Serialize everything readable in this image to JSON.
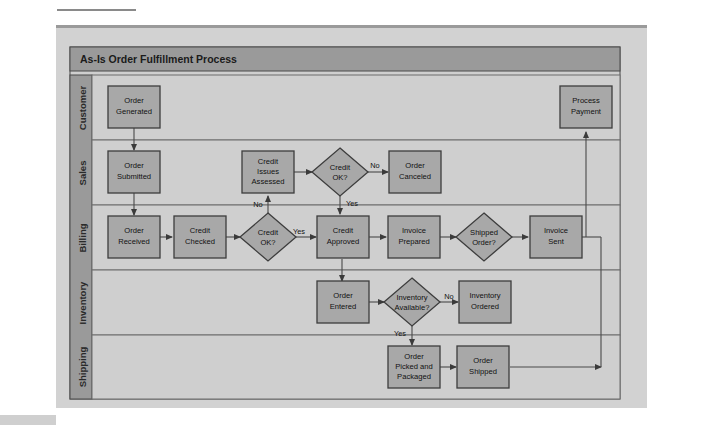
{
  "figure": {
    "title": "As-Is Order Fulfillment Process",
    "colors": {
      "panel_bg": "#d2d2d2",
      "title_bar": "#9a9a9a",
      "lane_header": "#9a9a9a",
      "lane_bg_light": "#cfcfcf",
      "node_fill": "#a8a8a8",
      "node_border": "#3d3d3d",
      "line": "#4a4a4a"
    }
  },
  "lanes": [
    {
      "id": "lane-customer",
      "label": "Customer"
    },
    {
      "id": "lane-sales",
      "label": "Sales"
    },
    {
      "id": "lane-billing",
      "label": "Billing"
    },
    {
      "id": "lane-inventory",
      "label": "Inventory"
    },
    {
      "id": "lane-shipping",
      "label": "Shipping"
    }
  ],
  "nodes": [
    {
      "id": "order-generated",
      "lane": "Customer",
      "shape": "process",
      "lines": [
        "Order",
        "Generated"
      ]
    },
    {
      "id": "process-payment",
      "lane": "Customer",
      "shape": "process",
      "lines": [
        "Process",
        "Payment"
      ]
    },
    {
      "id": "order-submitted",
      "lane": "Sales",
      "shape": "process",
      "lines": [
        "Order",
        "Submitted"
      ]
    },
    {
      "id": "credit-issues-assessed",
      "lane": "Sales",
      "shape": "process",
      "lines": [
        "Credit",
        "Issues",
        "Assessed"
      ]
    },
    {
      "id": "credit-ok-sales",
      "lane": "Sales",
      "shape": "decision",
      "lines": [
        "Credit",
        "OK?"
      ]
    },
    {
      "id": "order-canceled",
      "lane": "Sales",
      "shape": "process",
      "lines": [
        "Order",
        "Canceled"
      ]
    },
    {
      "id": "order-received",
      "lane": "Billing",
      "shape": "process",
      "lines": [
        "Order",
        "Received"
      ]
    },
    {
      "id": "credit-checked",
      "lane": "Billing",
      "shape": "process",
      "lines": [
        "Credit",
        "Checked"
      ]
    },
    {
      "id": "credit-ok-billing",
      "lane": "Billing",
      "shape": "decision",
      "lines": [
        "Credit",
        "OK?"
      ]
    },
    {
      "id": "credit-approved",
      "lane": "Billing",
      "shape": "process",
      "lines": [
        "Credit",
        "Approved"
      ]
    },
    {
      "id": "invoice-prepared",
      "lane": "Billing",
      "shape": "process",
      "lines": [
        "Invoice",
        "Prepared"
      ]
    },
    {
      "id": "shipped-order",
      "lane": "Billing",
      "shape": "decision",
      "lines": [
        "Shipped",
        "Order?"
      ]
    },
    {
      "id": "invoice-sent",
      "lane": "Billing",
      "shape": "process",
      "lines": [
        "Invoice",
        "Sent"
      ]
    },
    {
      "id": "order-entered",
      "lane": "Inventory",
      "shape": "process",
      "lines": [
        "Order",
        "Entered"
      ]
    },
    {
      "id": "inventory-available",
      "lane": "Inventory",
      "shape": "decision",
      "lines": [
        "Inventory",
        "Available?"
      ]
    },
    {
      "id": "inventory-ordered",
      "lane": "Inventory",
      "shape": "process",
      "lines": [
        "Inventory",
        "Ordered"
      ]
    },
    {
      "id": "order-picked-packaged",
      "lane": "Shipping",
      "shape": "process",
      "lines": [
        "Order",
        "Picked and",
        "Packaged"
      ]
    },
    {
      "id": "order-shipped",
      "lane": "Shipping",
      "shape": "process",
      "lines": [
        "Order",
        "Shipped"
      ]
    }
  ],
  "edges": [
    {
      "id": "e-generated-submitted",
      "from": "order-generated",
      "to": "order-submitted",
      "label": ""
    },
    {
      "id": "e-submitted-received",
      "from": "order-submitted",
      "to": "order-received",
      "label": ""
    },
    {
      "id": "e-received-checked",
      "from": "order-received",
      "to": "credit-checked",
      "label": ""
    },
    {
      "id": "e-checked-creditok",
      "from": "credit-checked",
      "to": "credit-ok-billing",
      "label": ""
    },
    {
      "id": "e-creditok-billing-yes",
      "from": "credit-ok-billing",
      "to": "credit-approved",
      "label": "Yes"
    },
    {
      "id": "e-creditok-billing-no",
      "from": "credit-ok-billing",
      "to": "credit-issues-assessed",
      "label": "No"
    },
    {
      "id": "e-issues-creditok-sales",
      "from": "credit-issues-assessed",
      "to": "credit-ok-sales",
      "label": ""
    },
    {
      "id": "e-creditok-sales-no",
      "from": "credit-ok-sales",
      "to": "order-canceled",
      "label": "No"
    },
    {
      "id": "e-creditok-sales-yes",
      "from": "credit-ok-sales",
      "to": "credit-approved",
      "label": "Yes"
    },
    {
      "id": "e-approved-invoice",
      "from": "credit-approved",
      "to": "invoice-prepared",
      "label": ""
    },
    {
      "id": "e-approved-entered",
      "from": "credit-approved",
      "to": "order-entered",
      "label": ""
    },
    {
      "id": "e-invoice-shipped-order",
      "from": "invoice-prepared",
      "to": "shipped-order",
      "label": ""
    },
    {
      "id": "e-shippedorder-invoicesent",
      "from": "shipped-order",
      "to": "invoice-sent",
      "label": ""
    },
    {
      "id": "e-invoicesent-payment",
      "from": "invoice-sent",
      "to": "process-payment",
      "label": ""
    },
    {
      "id": "e-entered-available",
      "from": "order-entered",
      "to": "inventory-available",
      "label": ""
    },
    {
      "id": "e-available-no",
      "from": "inventory-available",
      "to": "inventory-ordered",
      "label": "No"
    },
    {
      "id": "e-available-yes",
      "from": "inventory-available",
      "to": "order-picked-packaged",
      "label": "Yes"
    },
    {
      "id": "e-picked-shipped",
      "from": "order-picked-packaged",
      "to": "order-shipped",
      "label": ""
    },
    {
      "id": "e-shipped-payment",
      "from": "order-shipped",
      "to": "process-payment",
      "label": ""
    }
  ]
}
